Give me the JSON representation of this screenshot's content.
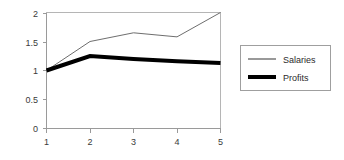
{
  "chart_data": {
    "type": "line",
    "title": "",
    "subtitle": "",
    "xlabel": "",
    "ylabel": "",
    "x": [
      1,
      2,
      3,
      4,
      5
    ],
    "categories": [
      "1",
      "2",
      "3",
      "4",
      "5"
    ],
    "series": [
      {
        "name": "Salaries",
        "values": [
          1.0,
          1.5,
          1.65,
          1.58,
          2.0
        ],
        "color": "#6e6e6e",
        "line_width": 1
      },
      {
        "name": "Profits",
        "values": [
          1.0,
          1.25,
          1.2,
          1.16,
          1.13
        ],
        "color": "#000000",
        "line_width": 4
      }
    ],
    "xlim": [
      1,
      5
    ],
    "ylim": [
      0,
      2
    ],
    "xticks": [
      1,
      2,
      3,
      4,
      5
    ],
    "xtick_labels": [
      "1",
      "2",
      "3",
      "4",
      "5"
    ],
    "yticks": [
      0,
      0.5,
      1,
      1.5,
      2
    ],
    "ytick_labels": [
      "0",
      "0.5",
      "1",
      "1.5",
      "2"
    ],
    "grid": false,
    "legend_position": "right",
    "background_color": "#ffffff"
  },
  "legend": {
    "entries": [
      {
        "label": "Salaries"
      },
      {
        "label": "Profits"
      }
    ]
  },
  "axes": {
    "y_labels": [
      "2",
      "1.5",
      "1",
      "0.5",
      "0"
    ],
    "x_labels": [
      "1",
      "2",
      "3",
      "4",
      "5"
    ]
  }
}
